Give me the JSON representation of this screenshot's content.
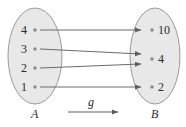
{
  "diagram": {
    "type": "function-mapping-diagram",
    "function_label": "g",
    "domain_set": {
      "name": "A",
      "elements": [
        "4",
        "3",
        "2",
        "1"
      ]
    },
    "codomain_set": {
      "name": "B",
      "elements": [
        "10",
        "4",
        "2"
      ]
    },
    "mappings": [
      {
        "from": "4",
        "to": "10"
      },
      {
        "from": "3",
        "to": "4"
      },
      {
        "from": "2",
        "to": "4"
      },
      {
        "from": "1",
        "to": "2"
      }
    ],
    "colors": {
      "ellipse_fill": "#e8e8e8",
      "ellipse_stroke": "#9a9a9a",
      "arrow": "#6b6b6b",
      "dot": "#8a8a8a",
      "text": "#2b2b2b",
      "background": "#ffffff"
    }
  }
}
